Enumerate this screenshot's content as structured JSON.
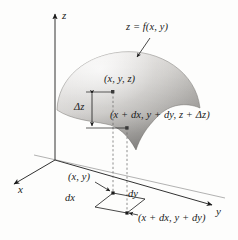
{
  "figure": {
    "background_color": "#fdfdfc",
    "ink_color": "#1b1b1b",
    "surface_fill_light": "#f1f0ee",
    "surface_fill_dark": "#8e8c8a"
  },
  "axes": {
    "z_label": "z",
    "x_label": "x",
    "y_label": "y"
  },
  "labels": {
    "surface_equation": "z = f(x, y)",
    "point_upper": "(x, y, z)",
    "point_lower": "(x + dx, y + dy, z + Δz)",
    "delta_z": "Δz",
    "base_point": "(x, y)",
    "dx": "dx",
    "dy": "dy",
    "base_point_offset": "(x + dx, y + dy)"
  }
}
